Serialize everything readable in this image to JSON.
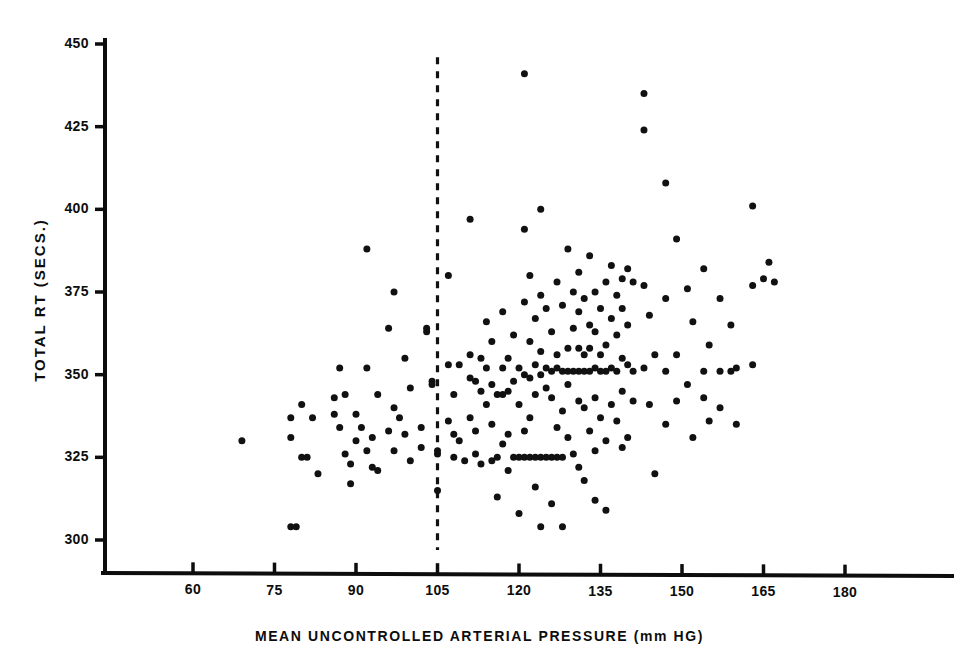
{
  "chart_data": {
    "type": "scatter",
    "title": "",
    "xlabel": "MEAN UNCONTROLLED ARTERIAL PRESSURE (mm HG)",
    "ylabel": "TOTAL RT (SECS.)",
    "xlim": [
      48,
      190
    ],
    "ylim": [
      294,
      452
    ],
    "xticks": [
      60,
      75,
      90,
      105,
      120,
      135,
      150,
      165,
      180
    ],
    "yticks": [
      300,
      325,
      350,
      375,
      400,
      425,
      450
    ],
    "xtick_labels": [
      "60",
      "75",
      "90",
      "105",
      "120",
      "135",
      "150",
      "165",
      "180"
    ],
    "ytick_labels": [
      "300",
      "325",
      "350",
      "375",
      "400",
      "425",
      "450"
    ],
    "grid": false,
    "legend": null,
    "marker_color": "#111111",
    "marker_size": 7,
    "annotations": [
      {
        "kind": "vertical-dashed-line",
        "x": 105,
        "y_from": 297,
        "y_to": 446,
        "color": "#111111",
        "label": ""
      }
    ],
    "points": [
      [
        69,
        330
      ],
      [
        78,
        337
      ],
      [
        78,
        331
      ],
      [
        78,
        304
      ],
      [
        79,
        304
      ],
      [
        80,
        341
      ],
      [
        80,
        325
      ],
      [
        81,
        325
      ],
      [
        82,
        337
      ],
      [
        83,
        320
      ],
      [
        86,
        343
      ],
      [
        86,
        338
      ],
      [
        87,
        352
      ],
      [
        87,
        334
      ],
      [
        88,
        344
      ],
      [
        88,
        326
      ],
      [
        89,
        323
      ],
      [
        89,
        317
      ],
      [
        90,
        338
      ],
      [
        90,
        330
      ],
      [
        91,
        334
      ],
      [
        92,
        388
      ],
      [
        92,
        352
      ],
      [
        92,
        327
      ],
      [
        93,
        331
      ],
      [
        93,
        322
      ],
      [
        94,
        344
      ],
      [
        94,
        321
      ],
      [
        96,
        364
      ],
      [
        96,
        333
      ],
      [
        97,
        375
      ],
      [
        97,
        340
      ],
      [
        97,
        327
      ],
      [
        98,
        337
      ],
      [
        99,
        355
      ],
      [
        99,
        332
      ],
      [
        100,
        346
      ],
      [
        100,
        324
      ],
      [
        102,
        334
      ],
      [
        102,
        328
      ],
      [
        103,
        364
      ],
      [
        103,
        363
      ],
      [
        104,
        348
      ],
      [
        104,
        347
      ],
      [
        105,
        327
      ],
      [
        105,
        326
      ],
      [
        105,
        315
      ],
      [
        107,
        380
      ],
      [
        107,
        353
      ],
      [
        107,
        336
      ],
      [
        108,
        344
      ],
      [
        108,
        332
      ],
      [
        108,
        325
      ],
      [
        109,
        353
      ],
      [
        109,
        330
      ],
      [
        110,
        324
      ],
      [
        111,
        397
      ],
      [
        111,
        356
      ],
      [
        111,
        349
      ],
      [
        111,
        337
      ],
      [
        112,
        348
      ],
      [
        112,
        333
      ],
      [
        112,
        326
      ],
      [
        113,
        355
      ],
      [
        113,
        345
      ],
      [
        113,
        323
      ],
      [
        114,
        366
      ],
      [
        114,
        352
      ],
      [
        114,
        341
      ],
      [
        115,
        360
      ],
      [
        115,
        347
      ],
      [
        115,
        335
      ],
      [
        115,
        324
      ],
      [
        116,
        344
      ],
      [
        116,
        325
      ],
      [
        116,
        313
      ],
      [
        117,
        369
      ],
      [
        117,
        352
      ],
      [
        117,
        344
      ],
      [
        117,
        329
      ],
      [
        118,
        355
      ],
      [
        118,
        345
      ],
      [
        118,
        332
      ],
      [
        118,
        321
      ],
      [
        119,
        362
      ],
      [
        119,
        348
      ],
      [
        119,
        325
      ],
      [
        120,
        352
      ],
      [
        120,
        341
      ],
      [
        120,
        325
      ],
      [
        120,
        308
      ],
      [
        121,
        441
      ],
      [
        121,
        394
      ],
      [
        121,
        372
      ],
      [
        121,
        350
      ],
      [
        121,
        333
      ],
      [
        121,
        325
      ],
      [
        122,
        380
      ],
      [
        122,
        360
      ],
      [
        122,
        349
      ],
      [
        122,
        337
      ],
      [
        122,
        325
      ],
      [
        123,
        367
      ],
      [
        123,
        353
      ],
      [
        123,
        344
      ],
      [
        123,
        325
      ],
      [
        123,
        316
      ],
      [
        124,
        400
      ],
      [
        124,
        374
      ],
      [
        124,
        357
      ],
      [
        124,
        350
      ],
      [
        124,
        325
      ],
      [
        124,
        304
      ],
      [
        125,
        370
      ],
      [
        125,
        352
      ],
      [
        125,
        346
      ],
      [
        125,
        325
      ],
      [
        126,
        363
      ],
      [
        126,
        351
      ],
      [
        126,
        343
      ],
      [
        126,
        325
      ],
      [
        126,
        311
      ],
      [
        127,
        378
      ],
      [
        127,
        356
      ],
      [
        127,
        352
      ],
      [
        127,
        334
      ],
      [
        127,
        325
      ],
      [
        128,
        371
      ],
      [
        128,
        351
      ],
      [
        128,
        339
      ],
      [
        128,
        325
      ],
      [
        128,
        304
      ],
      [
        129,
        388
      ],
      [
        129,
        358
      ],
      [
        129,
        351
      ],
      [
        129,
        347
      ],
      [
        129,
        331
      ],
      [
        130,
        375
      ],
      [
        130,
        364
      ],
      [
        130,
        351
      ],
      [
        130,
        326
      ],
      [
        131,
        381
      ],
      [
        131,
        369
      ],
      [
        131,
        358
      ],
      [
        131,
        351
      ],
      [
        131,
        342
      ],
      [
        131,
        322
      ],
      [
        132,
        373
      ],
      [
        132,
        356
      ],
      [
        132,
        351
      ],
      [
        132,
        340
      ],
      [
        132,
        318
      ],
      [
        133,
        386
      ],
      [
        133,
        365
      ],
      [
        133,
        358
      ],
      [
        133,
        351
      ],
      [
        133,
        333
      ],
      [
        134,
        375
      ],
      [
        134,
        363
      ],
      [
        134,
        352
      ],
      [
        134,
        343
      ],
      [
        134,
        327
      ],
      [
        134,
        312
      ],
      [
        135,
        370
      ],
      [
        135,
        356
      ],
      [
        135,
        351
      ],
      [
        135,
        337
      ],
      [
        136,
        378
      ],
      [
        136,
        359
      ],
      [
        136,
        351
      ],
      [
        136,
        330
      ],
      [
        136,
        309
      ],
      [
        137,
        383
      ],
      [
        137,
        367
      ],
      [
        137,
        352
      ],
      [
        137,
        341
      ],
      [
        138,
        374
      ],
      [
        138,
        362
      ],
      [
        138,
        351
      ],
      [
        138,
        336
      ],
      [
        139,
        379
      ],
      [
        139,
        370
      ],
      [
        139,
        355
      ],
      [
        139,
        345
      ],
      [
        139,
        328
      ],
      [
        140,
        382
      ],
      [
        140,
        365
      ],
      [
        140,
        353
      ],
      [
        140,
        331
      ],
      [
        141,
        378
      ],
      [
        141,
        351
      ],
      [
        141,
        342
      ],
      [
        143,
        435
      ],
      [
        143,
        424
      ],
      [
        143,
        377
      ],
      [
        143,
        352
      ],
      [
        144,
        368
      ],
      [
        144,
        341
      ],
      [
        145,
        356
      ],
      [
        145,
        320
      ],
      [
        147,
        408
      ],
      [
        147,
        373
      ],
      [
        147,
        351
      ],
      [
        147,
        335
      ],
      [
        149,
        391
      ],
      [
        149,
        356
      ],
      [
        149,
        342
      ],
      [
        151,
        376
      ],
      [
        151,
        347
      ],
      [
        152,
        366
      ],
      [
        152,
        331
      ],
      [
        154,
        382
      ],
      [
        154,
        351
      ],
      [
        154,
        343
      ],
      [
        155,
        359
      ],
      [
        155,
        336
      ],
      [
        157,
        373
      ],
      [
        157,
        351
      ],
      [
        157,
        340
      ],
      [
        159,
        365
      ],
      [
        159,
        351
      ],
      [
        160,
        352
      ],
      [
        160,
        335
      ],
      [
        163,
        401
      ],
      [
        163,
        377
      ],
      [
        163,
        353
      ],
      [
        165,
        379
      ],
      [
        166,
        384
      ],
      [
        167,
        378
      ]
    ]
  },
  "axes": {
    "y_axis_name": "y-axis",
    "x_axis_name": "x-axis"
  }
}
